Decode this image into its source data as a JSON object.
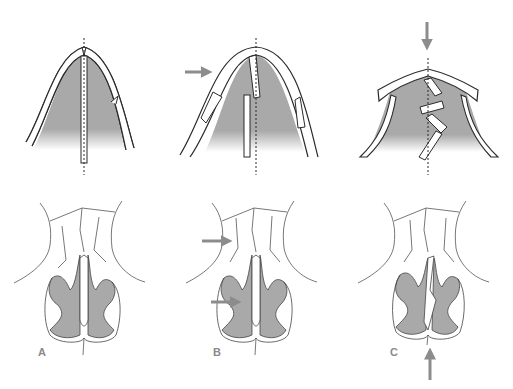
{
  "figure": {
    "panels": [
      {
        "id": "A",
        "label": "A",
        "description": "Schematic: midline split with dashed axis; anatomical view below"
      },
      {
        "id": "B",
        "label": "B",
        "description": "Schematic: lateral displacement with arrow; anatomical view with two arrows"
      },
      {
        "id": "C",
        "label": "C",
        "description": "Schematic: downward compression arrow with zig-zag fragments; anatomical view with upward arrow"
      }
    ],
    "colors": {
      "fill_gray": "#a9a9a9",
      "outline": "#2b2b2b",
      "arrow": "#8c8c8c",
      "label": "#8a8a8a",
      "background": "#ffffff"
    },
    "arrows": [
      {
        "panel": "B",
        "position": "upper",
        "direction": "right"
      },
      {
        "panel": "C",
        "position": "upper",
        "direction": "down"
      },
      {
        "panel": "B",
        "position": "lower-top",
        "direction": "right"
      },
      {
        "panel": "B",
        "position": "lower-bottom",
        "direction": "right"
      },
      {
        "panel": "C",
        "position": "lower",
        "direction": "up"
      }
    ]
  }
}
